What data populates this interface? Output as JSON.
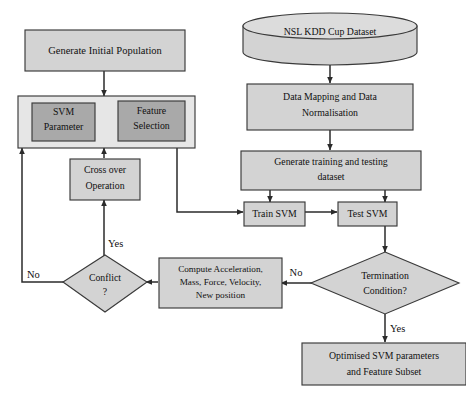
{
  "diagram": {
    "colors": {
      "box_light": "#d3d3d3",
      "box_dark": "#a9a9a9",
      "box_pale": "#e6e6e6",
      "cylinder_top": "#dcdcdc",
      "outline": "#3a3a3a",
      "connector": "#2b2b2b",
      "background": "#ffffff",
      "text": "#101010"
    },
    "nodes": [
      {
        "id": "generate-initial-population",
        "type": "process",
        "lines": [
          "Generate Initial Population"
        ],
        "fill": "light"
      },
      {
        "id": "ga-container",
        "type": "process",
        "lines": [],
        "fill": "pale"
      },
      {
        "id": "svm-parameter",
        "type": "process",
        "lines": [
          "SVM",
          "Parameter"
        ],
        "fill": "dark"
      },
      {
        "id": "feature-selection",
        "type": "process",
        "lines": [
          "Feature",
          "Selection"
        ],
        "fill": "dark"
      },
      {
        "id": "cross-over-operation",
        "type": "process",
        "lines": [
          "Cross over",
          "Operation"
        ],
        "fill": "light"
      },
      {
        "id": "conflict",
        "type": "decision",
        "lines": [
          "Conflict",
          "?"
        ],
        "fill": "light"
      },
      {
        "id": "compute-acceleration",
        "type": "process",
        "lines": [
          "Compute Acceleration,",
          "Mass, Force, Velocity,",
          "New position"
        ],
        "fill": "light"
      },
      {
        "id": "nsl-kdd-cup-dataset",
        "type": "database",
        "lines": [
          "NSL KDD Cup Dataset"
        ],
        "fill": "light"
      },
      {
        "id": "data-mapping-normalisation",
        "type": "process",
        "lines": [
          "Data Mapping and Data",
          "Normalisation"
        ],
        "fill": "light"
      },
      {
        "id": "generate-training-testing-dataset",
        "type": "process",
        "lines": [
          "Generate training and testing",
          "dataset"
        ],
        "fill": "light"
      },
      {
        "id": "train-svm",
        "type": "process",
        "lines": [
          "Train SVM"
        ],
        "fill": "light"
      },
      {
        "id": "test-svm",
        "type": "process",
        "lines": [
          "Test SVM"
        ],
        "fill": "light"
      },
      {
        "id": "termination-condition",
        "type": "decision",
        "lines": [
          "Termination",
          "Condition?"
        ],
        "fill": "light"
      },
      {
        "id": "optimised-svm-parameters",
        "type": "process",
        "lines": [
          "Optimised SVM parameters",
          "and Feature Subset"
        ],
        "fill": "light"
      }
    ],
    "labels": {
      "generate_initial_population": "Generate Initial Population",
      "svm_parameter_l1": "SVM",
      "svm_parameter_l2": "Parameter",
      "feature_selection_l1": "Feature",
      "feature_selection_l2": "Selection",
      "cross_over_l1": "Cross over",
      "cross_over_l2": "Operation",
      "conflict_l1": "Conflict",
      "conflict_l2": "?",
      "compute_l1": "Compute Acceleration,",
      "compute_l2": "Mass, Force, Velocity,",
      "compute_l3": "New position",
      "dataset": "NSL KDD Cup Dataset",
      "data_mapping_l1": "Data Mapping and Data",
      "data_mapping_l2": "Normalisation",
      "generate_training_l1": "Generate training and testing",
      "generate_training_l2": "dataset",
      "train_svm": "Train SVM",
      "test_svm": "Test SVM",
      "termination_l1": "Termination",
      "termination_l2": "Condition?",
      "optimised_l1": "Optimised SVM parameters",
      "optimised_l2": "and Feature Subset"
    },
    "edge_labels": {
      "conflict_yes": "Yes",
      "conflict_no": "No",
      "termination_no": "No",
      "termination_yes": "Yes"
    },
    "edges": [
      {
        "id": "init-to-ga",
        "from": "generate-initial-population",
        "to": "ga-container",
        "label": ""
      },
      {
        "id": "crossover-to-ga",
        "from": "cross-over-operation",
        "to": "ga-container",
        "label": ""
      },
      {
        "id": "conflict-no-to-ga",
        "from": "conflict",
        "to": "ga-container",
        "label": "No"
      },
      {
        "id": "conflict-yes-to-crossover",
        "from": "conflict",
        "to": "cross-over-operation",
        "label": "Yes"
      },
      {
        "id": "compute-to-conflict",
        "from": "compute-acceleration",
        "to": "conflict",
        "label": ""
      },
      {
        "id": "ga-to-train",
        "from": "ga-container",
        "to": "train-svm",
        "label": ""
      },
      {
        "id": "dataset-to-mapping",
        "from": "nsl-kdd-cup-dataset",
        "to": "data-mapping-normalisation",
        "label": ""
      },
      {
        "id": "mapping-to-generate",
        "from": "data-mapping-normalisation",
        "to": "generate-training-testing-dataset",
        "label": ""
      },
      {
        "id": "generate-to-train",
        "from": "generate-training-testing-dataset",
        "to": "train-svm",
        "label": ""
      },
      {
        "id": "generate-to-test",
        "from": "generate-training-testing-dataset",
        "to": "test-svm",
        "label": ""
      },
      {
        "id": "train-to-test",
        "from": "train-svm",
        "to": "test-svm",
        "label": ""
      },
      {
        "id": "test-to-termination",
        "from": "test-svm",
        "to": "termination-condition",
        "label": ""
      },
      {
        "id": "termination-no-to-compute",
        "from": "termination-condition",
        "to": "compute-acceleration",
        "label": "No"
      },
      {
        "id": "termination-yes-to-optimised",
        "from": "termination-condition",
        "to": "optimised-svm-parameters",
        "label": "Yes"
      }
    ]
  }
}
